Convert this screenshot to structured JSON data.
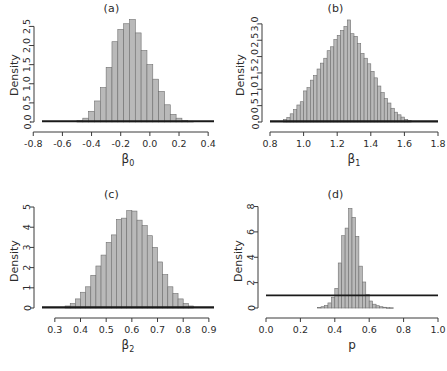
{
  "figure": {
    "panels": [
      {
        "title": "(a)",
        "ylabel": "Density",
        "xlabel_main": "β",
        "xlabel_sub": "0",
        "xticks": [
          "-0.8",
          "-0.6",
          "-0.4",
          "-0.2",
          "0.0",
          "0.2",
          "0.4"
        ],
        "xtick_values": [
          -0.8,
          -0.6,
          -0.4,
          -0.2,
          0.0,
          0.2,
          0.4
        ],
        "yticks": [
          "0.0",
          "0.5",
          "1.0",
          "1.5",
          "2.0",
          "2.5"
        ],
        "ytick_values": [
          0.0,
          0.5,
          1.0,
          1.5,
          2.0,
          2.5
        ],
        "xlim": [
          -0.74,
          0.44
        ],
        "ylim": [
          0,
          2.72
        ],
        "prior_level": 0.02
      },
      {
        "title": "(b)",
        "ylabel": "Density",
        "xlabel_main": "β",
        "xlabel_sub": "1",
        "xticks": [
          "0.8",
          "1.0",
          "1.2",
          "1.4",
          "1.6",
          "1.8"
        ],
        "xtick_values": [
          0.8,
          1.0,
          1.2,
          1.4,
          1.6,
          1.8
        ],
        "yticks": [
          "0.0",
          "0.5",
          "1.0",
          "1.5",
          "2.0",
          "2.5",
          "3.0"
        ],
        "ytick_values": [
          0.0,
          0.5,
          1.0,
          1.5,
          2.0,
          2.5,
          3.0
        ],
        "xlim": [
          0.8,
          1.8
        ],
        "ylim": [
          0,
          3.18
        ],
        "prior_level": 0.02
      },
      {
        "title": "(c)",
        "ylabel": "Density",
        "xlabel_main": "β",
        "xlabel_sub": "2",
        "xticks": [
          "0.3",
          "0.4",
          "0.5",
          "0.6",
          "0.7",
          "0.8",
          "0.9"
        ],
        "xtick_values": [
          0.3,
          0.4,
          0.5,
          0.6,
          0.7,
          0.8,
          0.9
        ],
        "yticks": [
          "0",
          "1",
          "2",
          "3",
          "4",
          "5"
        ],
        "ytick_values": [
          0,
          1,
          2,
          3,
          4,
          5
        ],
        "xlim": [
          0.25,
          0.92
        ],
        "ylim": [
          0,
          5.15
        ],
        "prior_level": 0.03
      },
      {
        "title": "(d)",
        "ylabel": "Density",
        "xlabel_main": "p",
        "xlabel_sub": "",
        "xticks": [
          "0.0",
          "0.2",
          "0.4",
          "0.6",
          "0.8",
          "1.0"
        ],
        "xtick_values": [
          0.0,
          0.2,
          0.4,
          0.6,
          0.8,
          1.0
        ],
        "yticks": [
          "0",
          "2",
          "4",
          "6",
          "8"
        ],
        "ytick_values": [
          0,
          2,
          4,
          6,
          8
        ],
        "xlim": [
          0.0,
          1.0
        ],
        "ylim": [
          0,
          8.2
        ],
        "prior_level": 1.0
      }
    ],
    "colors": {
      "bar_fill": "#b9b9b9",
      "bar_border": "#6f6f6f",
      "axis": "#3a3a3a",
      "prior_line": "#1a1a1a",
      "text": "#2b2b2b",
      "background": "#ffffff"
    }
  },
  "chart_data": [
    {
      "type": "bar",
      "title": "(a)",
      "xlabel": "β0",
      "ylabel": "Density",
      "xlim": [
        -0.74,
        0.44
      ],
      "ylim": [
        0,
        2.72
      ],
      "grid": false,
      "legend": "none",
      "bin_width": 0.04,
      "bin_left_edges": [
        -0.5,
        -0.46,
        -0.42,
        -0.38,
        -0.34,
        -0.3,
        -0.26,
        -0.22,
        -0.18,
        -0.14,
        -0.1,
        -0.06,
        -0.02,
        0.02,
        0.06,
        0.1,
        0.14,
        0.18,
        0.22,
        0.26
      ],
      "categories": [
        "-0.50",
        "-0.46",
        "-0.42",
        "-0.38",
        "-0.34",
        "-0.30",
        "-0.26",
        "-0.22",
        "-0.18",
        "-0.14",
        "-0.10",
        "-0.06",
        "-0.02",
        "0.02",
        "0.06",
        "0.10",
        "0.14",
        "0.18",
        "0.22",
        "0.26"
      ],
      "values": [
        0.04,
        0.1,
        0.28,
        0.55,
        0.9,
        1.43,
        2.1,
        2.42,
        2.57,
        2.68,
        2.33,
        1.87,
        1.5,
        1.12,
        0.8,
        0.45,
        0.2,
        0.1,
        0.04,
        0.02
      ],
      "annotations": [
        {
          "type": "hline",
          "y": 0.02,
          "label": "prior density"
        }
      ]
    },
    {
      "type": "bar",
      "title": "(b)",
      "xlabel": "β1",
      "ylabel": "Density",
      "xlim": [
        0.8,
        1.8
      ],
      "ylim": [
        0,
        3.18
      ],
      "grid": false,
      "legend": "none",
      "bin_width": 0.02,
      "bin_left_edges": [
        0.88,
        0.9,
        0.92,
        0.94,
        0.96,
        0.98,
        1.0,
        1.02,
        1.04,
        1.06,
        1.08,
        1.1,
        1.12,
        1.14,
        1.16,
        1.18,
        1.2,
        1.22,
        1.24,
        1.26,
        1.28,
        1.3,
        1.32,
        1.34,
        1.36,
        1.38,
        1.4,
        1.42,
        1.44,
        1.46,
        1.48,
        1.5,
        1.52,
        1.54,
        1.56,
        1.58,
        1.6,
        1.62
      ],
      "categories": [
        "0.88",
        "0.90",
        "0.92",
        "0.94",
        "0.96",
        "0.98",
        "1.00",
        "1.02",
        "1.04",
        "1.06",
        "1.08",
        "1.10",
        "1.12",
        "1.14",
        "1.16",
        "1.18",
        "1.20",
        "1.22",
        "1.24",
        "1.26",
        "1.28",
        "1.30",
        "1.32",
        "1.34",
        "1.36",
        "1.38",
        "1.40",
        "1.42",
        "1.44",
        "1.46",
        "1.48",
        "1.50",
        "1.52",
        "1.54",
        "1.56",
        "1.58",
        "1.60",
        "1.62"
      ],
      "values": [
        0.08,
        0.14,
        0.25,
        0.38,
        0.52,
        0.62,
        0.95,
        1.05,
        1.28,
        1.42,
        1.62,
        1.8,
        1.95,
        2.18,
        2.3,
        2.52,
        2.65,
        2.8,
        2.92,
        3.12,
        2.7,
        2.62,
        2.4,
        2.1,
        1.95,
        1.78,
        1.55,
        1.35,
        1.1,
        0.9,
        0.72,
        0.58,
        0.42,
        0.3,
        0.22,
        0.15,
        0.08,
        0.04
      ],
      "annotations": [
        {
          "type": "hline",
          "y": 0.02,
          "label": "prior density"
        }
      ]
    },
    {
      "type": "bar",
      "title": "(c)",
      "xlabel": "β2",
      "ylabel": "Density",
      "xlim": [
        0.25,
        0.92
      ],
      "ylim": [
        0,
        5.15
      ],
      "grid": false,
      "legend": "none",
      "bin_width": 0.02,
      "bin_left_edges": [
        0.34,
        0.36,
        0.38,
        0.4,
        0.42,
        0.44,
        0.46,
        0.48,
        0.5,
        0.52,
        0.54,
        0.56,
        0.58,
        0.6,
        0.62,
        0.64,
        0.66,
        0.68,
        0.7,
        0.72,
        0.74,
        0.76,
        0.78,
        0.8,
        0.82
      ],
      "categories": [
        "0.34",
        "0.36",
        "0.38",
        "0.40",
        "0.42",
        "0.44",
        "0.46",
        "0.48",
        "0.50",
        "0.52",
        "0.54",
        "0.56",
        "0.58",
        "0.60",
        "0.62",
        "0.64",
        "0.66",
        "0.68",
        "0.70",
        "0.72",
        "0.74",
        "0.76",
        "0.78",
        "0.80",
        "0.82"
      ],
      "values": [
        0.1,
        0.22,
        0.45,
        0.78,
        1.05,
        1.62,
        2.08,
        2.62,
        3.25,
        3.62,
        4.38,
        4.45,
        4.82,
        4.8,
        4.35,
        4.08,
        3.58,
        3.0,
        2.28,
        1.65,
        1.05,
        0.72,
        0.45,
        0.22,
        0.1
      ],
      "annotations": [
        {
          "type": "hline",
          "y": 0.03,
          "label": "prior density"
        }
      ]
    },
    {
      "type": "bar",
      "title": "(d)",
      "xlabel": "p",
      "ylabel": "Density",
      "xlim": [
        0.0,
        1.0
      ],
      "ylim": [
        0,
        8.2
      ],
      "grid": false,
      "legend": "none",
      "bin_width": 0.02,
      "bin_left_edges": [
        0.3,
        0.32,
        0.34,
        0.36,
        0.38,
        0.4,
        0.42,
        0.44,
        0.46,
        0.48,
        0.5,
        0.52,
        0.54,
        0.56,
        0.58,
        0.6,
        0.62,
        0.64,
        0.66,
        0.68,
        0.7,
        0.72
      ],
      "categories": [
        "0.30",
        "0.32",
        "0.34",
        "0.36",
        "0.38",
        "0.40",
        "0.42",
        "0.44",
        "0.46",
        "0.48",
        "0.50",
        "0.52",
        "0.54",
        "0.56",
        "0.58",
        "0.60",
        "0.62",
        "0.64",
        "0.66",
        "0.68",
        "0.70",
        "0.72"
      ],
      "values": [
        0.05,
        0.1,
        0.2,
        0.4,
        0.85,
        1.55,
        3.55,
        5.7,
        6.3,
        7.85,
        7.15,
        5.65,
        3.3,
        2.05,
        1.05,
        0.55,
        0.3,
        0.18,
        0.1,
        0.06,
        0.03,
        0.02
      ],
      "annotations": [
        {
          "type": "hline",
          "y": 1.0,
          "label": "uniform prior density = 1"
        }
      ]
    }
  ]
}
